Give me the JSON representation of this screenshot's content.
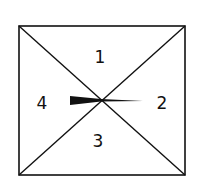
{
  "diagram": {
    "type": "spinner",
    "regions": [
      {
        "id": "region-1",
        "label": "1",
        "position": "top"
      },
      {
        "id": "region-2",
        "label": "2",
        "position": "right"
      },
      {
        "id": "region-3",
        "label": "3",
        "position": "bottom"
      },
      {
        "id": "region-4",
        "label": "4",
        "position": "left"
      }
    ],
    "pointer": {
      "points_to": "2"
    },
    "colors": {
      "stroke": "#111111",
      "background": "#ffffff"
    }
  }
}
